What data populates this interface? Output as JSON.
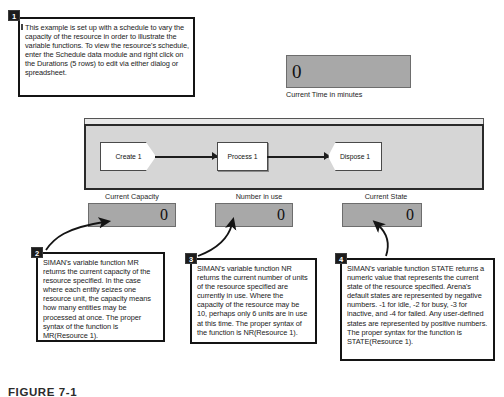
{
  "callouts": [
    {
      "number": "1",
      "text": "This example is set up with a schedule to vary the capacity of the resource in order to illustrate the variable functions. To view the resource's schedule, enter the Schedule data module and right click on the Durations (5 rows) to edit via either dialog or spreadsheet."
    },
    {
      "number": "2",
      "text": "SIMAN's variable function MR returns the current capacity of the resource specified. In the case where each entity seizes one resource unit, the capacity means how many entities may be processed at once. The proper syntax of the function is MR(Resource 1)."
    },
    {
      "number": "3",
      "text": "SIMAN's variable function NR returns the current number of units of the resource specified are currently in use. Where the capacity of the resource may be 10, perhaps only 6 units are in use at this time. The proper syntax of the function is NR(Resource 1)."
    },
    {
      "number": "4",
      "text": "SIMAN's variable function STATE returns a numeric value that represents the current state of the resource specified. Arena's default states are represented by negative numbers. -1 for idle, -2 for busy, -3 for inactive, and -4 for failed. Any user-defined states are represented by positive numbers. The proper syntax for the function is\nSTATE(Resource 1)."
    }
  ],
  "time_display": {
    "value": "0",
    "label": "Current Time in minutes"
  },
  "flowchart": {
    "nodes": [
      {
        "label": "Create 1"
      },
      {
        "label": "Process 1"
      },
      {
        "label": "Dispose 1"
      }
    ]
  },
  "stats": [
    {
      "label": "Current Capacity",
      "value": "0"
    },
    {
      "label": "Number in use",
      "value": "0"
    },
    {
      "label": "Current State",
      "value": "0"
    }
  ],
  "caption": "FIGURE 7-1"
}
